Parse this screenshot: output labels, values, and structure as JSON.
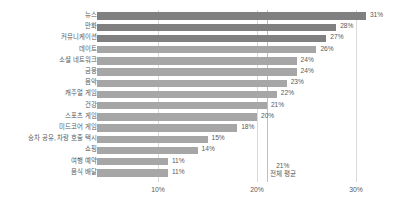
{
  "chart_data": {
    "type": "bar",
    "orientation": "horizontal",
    "title": "",
    "xlabel": "",
    "ylabel": "",
    "xlim": [
      4,
      32
    ],
    "xticks": [
      "10%",
      "20%",
      "30%"
    ],
    "xtick_values": [
      10,
      20,
      30
    ],
    "grid": true,
    "legend": null,
    "categories": [
      "뉴스",
      "만화",
      "커뮤니케이션",
      "데이트",
      "소셜 네트워크",
      "금융",
      "음악",
      "캐주얼 게임",
      "건강",
      "스포츠 게임",
      "미드코어 게임",
      "승차 공유, 차량 호출 택시",
      "쇼핑",
      "여행 예약",
      "음식 배달"
    ],
    "values": [
      31,
      28,
      27,
      26,
      24,
      24,
      23,
      22,
      21,
      20,
      18,
      15,
      14,
      11,
      11
    ],
    "value_labels": [
      "31%",
      "28%",
      "27%",
      "26%",
      "24%",
      "24%",
      "23%",
      "22%",
      "21%",
      "20%",
      "18%",
      "15%",
      "14%",
      "11%",
      "11%"
    ],
    "highlighted_indices": [
      0,
      1,
      2
    ],
    "annotations": [
      {
        "name": "overall-average",
        "value": 21,
        "line1": "21%",
        "line2": "전체 평균"
      }
    ],
    "colors": {
      "bar": "#a6a6a6",
      "bar_highlight": "#808080",
      "gridline": "#d9d9d9",
      "average_line": "#bfbfbf",
      "text": "#595959",
      "background": "#ffffff"
    }
  }
}
